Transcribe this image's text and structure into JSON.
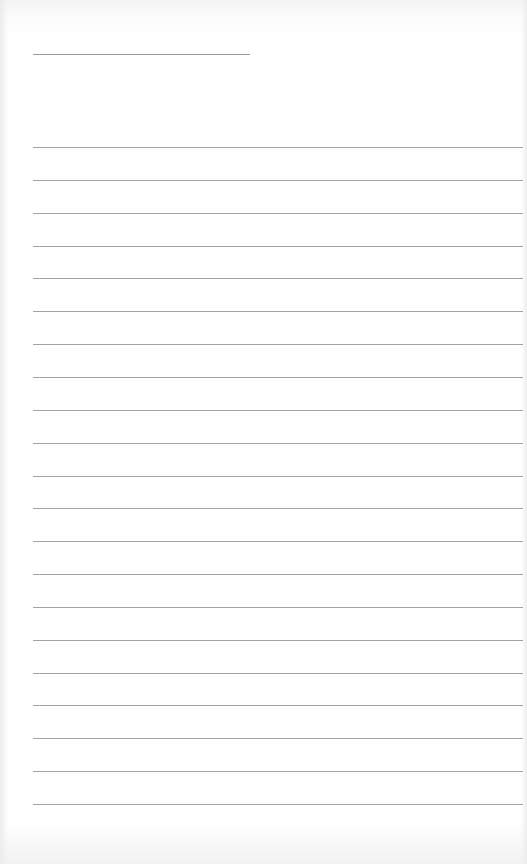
{
  "page": {
    "type": "blank lined paper",
    "header_line": {
      "x": 33,
      "y": 54,
      "width": 217
    },
    "rules": {
      "count": 21,
      "first_y": 147,
      "spacing": 32.85,
      "left": 33
    },
    "line_color": "#a3a3a3",
    "paper_color": "#ffffff"
  }
}
